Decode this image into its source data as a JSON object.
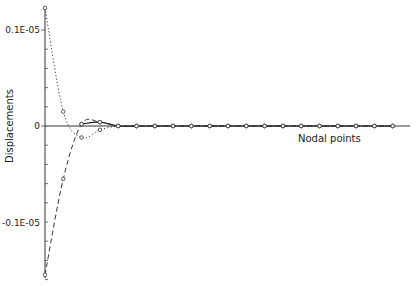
{
  "chart_data": {
    "type": "line",
    "title": "",
    "xlabel": "Nodal points",
    "ylabel": "Displacements",
    "yticks": [
      {
        "value": 1e-06,
        "label": "0.1E-05"
      },
      {
        "value": 0,
        "label": "0"
      },
      {
        "value": -1e-06,
        "label": "-0.1E-05"
      }
    ],
    "ylim": [
      -1.55e-06,
      1.23e-06
    ],
    "y_minor_ticks_per_major": 5,
    "x": [
      0,
      1,
      2,
      3,
      4,
      5,
      6,
      7,
      8,
      9,
      10,
      11,
      12,
      13,
      14,
      15,
      16,
      17,
      18,
      19
    ],
    "grid": false,
    "legend": null,
    "series": [
      {
        "name": "dotted",
        "style": "dotted",
        "values": [
          1.23e-06,
          1.5e-07,
          -1.2e-07,
          -4e-08,
          0.0,
          0.0,
          0.0,
          0.0,
          0.0,
          0.0,
          0.0,
          0.0,
          0.0,
          0.0,
          0.0,
          0.0,
          0.0,
          0.0,
          0.0,
          0.0
        ]
      },
      {
        "name": "dashed",
        "style": "dashed",
        "values": [
          -1.55e-06,
          -5.5e-07,
          2e-08,
          4e-08,
          0.0,
          0.0,
          0.0,
          0.0,
          0.0,
          0.0,
          0.0,
          0.0,
          0.0,
          0.0,
          0.0,
          0.0,
          0.0,
          0.0,
          0.0,
          0.0
        ]
      },
      {
        "name": "solid",
        "style": "solid",
        "values": [
          null,
          null,
          2e-08,
          4e-08,
          0.0,
          0.0,
          0.0,
          0.0,
          0.0,
          0.0,
          0.0,
          0.0,
          0.0,
          0.0,
          0.0,
          0.0,
          0.0,
          0.0,
          0.0,
          0.0
        ]
      }
    ]
  },
  "labels": {
    "y_axis_title": "Displacements",
    "x_axis_title": "Nodal points",
    "ytick_top": "0.1E-05",
    "ytick_zero": "0",
    "ytick_bottom": "-0.1E-05"
  }
}
